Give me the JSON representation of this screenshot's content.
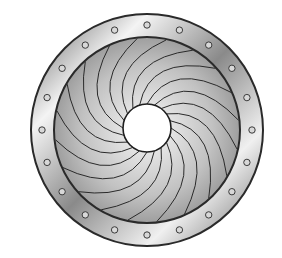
{
  "figure": {
    "center": [
      147,
      130
    ],
    "outer_radius": 116,
    "inner_radius": 93,
    "bolt_circle_radius": 105,
    "bolt_count": 20,
    "bolt_radius": 3.2,
    "aperture_center": [
      147,
      128
    ],
    "aperture_radius": 24,
    "blade_count": 20,
    "colors": {
      "background": "#ffffff",
      "ring_light": "#f2f2f2",
      "ring_dark": "#6e6e6e",
      "blade_fill": "#bdbdbd",
      "blade_light": "#e6e6e6",
      "stroke": "#2a2a2a",
      "aperture": "#ffffff"
    }
  }
}
